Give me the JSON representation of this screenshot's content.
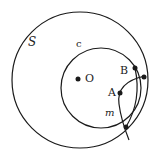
{
  "labels": {
    "S": "S",
    "c": "c",
    "O": "O",
    "A": "A",
    "B": "B",
    "m": "m"
  },
  "colors": {
    "stroke": "#1a1a1a",
    "background": "#ffffff"
  }
}
